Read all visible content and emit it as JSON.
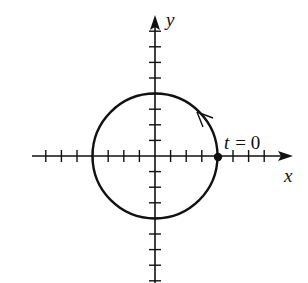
{
  "diagram": {
    "type": "parametric-circle",
    "axes": {
      "x_label": "x",
      "y_label": "y",
      "origin_px": [
        155,
        156
      ],
      "tick_spacing_px": 15.6,
      "x_ticks": [
        -7,
        -6,
        -5,
        -4,
        -3,
        -2,
        -1,
        1,
        2,
        3,
        4,
        5,
        6,
        7
      ],
      "y_ticks": [
        -8,
        -7,
        -6,
        -5,
        -4,
        -3,
        -2,
        -1,
        1,
        2,
        3,
        4,
        5,
        6,
        7,
        8
      ]
    },
    "circle": {
      "center": [
        0,
        0
      ],
      "radius_ticks": 4,
      "direction": "counterclockwise"
    },
    "start_point": {
      "label_var": "t",
      "label_eq": "= 0",
      "position": [
        4,
        0
      ]
    }
  }
}
